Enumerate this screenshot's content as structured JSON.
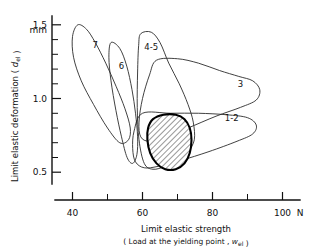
{
  "chart_data": {
    "type": "scatter",
    "title": "",
    "xlabel": "Limit elastic strength",
    "xlabel_sub": "( Load at the yielding point , w_el )",
    "ylabel": "Limit elastic deformation ( d_el )",
    "yunit": "mm",
    "xunit": "N",
    "xlim": [
      35,
      105
    ],
    "ylim": [
      0.42,
      1.56
    ],
    "xticks": [
      40,
      60,
      80,
      100
    ],
    "xticks_minor": [
      50,
      70,
      90
    ],
    "yticks": [
      0.5,
      1.0,
      1.5
    ],
    "yticks_minor": [
      0.6,
      0.7,
      0.8,
      0.9,
      1.1,
      1.2,
      1.3,
      1.4
    ],
    "xtick_labels": [
      "40",
      "60",
      "80",
      "100"
    ],
    "ytick_labels": [
      "0.5",
      "1.0",
      "1.5"
    ],
    "grid": false,
    "legend": "none",
    "note": "Overlapping closed contour regions (scatter envelopes) for seven sample groups, plus one bold hatched common-overlap region.",
    "series": [
      {
        "name": "7",
        "label": "7",
        "label_x": 46.5,
        "label_y": 1.34,
        "points": [
          [
            41.5,
            1.5
          ],
          [
            44.0,
            1.47
          ],
          [
            46.5,
            1.38
          ],
          [
            49.5,
            1.24
          ],
          [
            52.5,
            1.08
          ],
          [
            55.0,
            0.93
          ],
          [
            56.5,
            0.8
          ],
          [
            56.0,
            0.72
          ],
          [
            53.5,
            0.7
          ],
          [
            50.0,
            0.8
          ],
          [
            46.0,
            0.96
          ],
          [
            42.5,
            1.12
          ],
          [
            40.3,
            1.28
          ],
          [
            40.0,
            1.42
          ]
        ]
      },
      {
        "name": "6",
        "label": "6",
        "label_x": 54.0,
        "label_y": 1.2,
        "points": [
          [
            51.0,
            1.38
          ],
          [
            53.5,
            1.34
          ],
          [
            55.5,
            1.22
          ],
          [
            57.0,
            1.06
          ],
          [
            58.0,
            0.9
          ],
          [
            58.6,
            0.74
          ],
          [
            58.4,
            0.62
          ],
          [
            57.2,
            0.56
          ],
          [
            55.6,
            0.6
          ],
          [
            54.0,
            0.74
          ],
          [
            52.4,
            0.92
          ],
          [
            51.0,
            1.12
          ],
          [
            50.4,
            1.28
          ]
        ]
      },
      {
        "name": "4-5",
        "label": "4-5",
        "label_x": 62.5,
        "label_y": 1.33,
        "points": [
          [
            59.5,
            1.44
          ],
          [
            62.5,
            1.45
          ],
          [
            65.0,
            1.38
          ],
          [
            67.5,
            1.24
          ],
          [
            70.5,
            1.1
          ],
          [
            73.0,
            0.96
          ],
          [
            74.5,
            0.84
          ],
          [
            74.8,
            0.72
          ],
          [
            73.0,
            0.64
          ],
          [
            70.0,
            0.58
          ],
          [
            66.5,
            0.54
          ],
          [
            63.0,
            0.52
          ],
          [
            60.5,
            0.56
          ],
          [
            59.0,
            0.72
          ],
          [
            58.5,
            0.94
          ],
          [
            58.6,
            1.18
          ],
          [
            58.9,
            1.36
          ]
        ]
      },
      {
        "name": "3",
        "label": "3",
        "label_x": 88.0,
        "label_y": 1.08,
        "points": [
          [
            64.0,
            1.26
          ],
          [
            70.0,
            1.27
          ],
          [
            76.0,
            1.24
          ],
          [
            82.0,
            1.19
          ],
          [
            87.5,
            1.15
          ],
          [
            91.5,
            1.12
          ],
          [
            93.5,
            1.06
          ],
          [
            92.5,
            0.99
          ],
          [
            88.0,
            0.94
          ],
          [
            81.0,
            0.88
          ],
          [
            73.0,
            0.8
          ],
          [
            66.5,
            0.74
          ],
          [
            62.0,
            0.71
          ],
          [
            59.5,
            0.74
          ],
          [
            59.0,
            0.84
          ],
          [
            60.0,
            1.0
          ],
          [
            62.0,
            1.16
          ]
        ]
      },
      {
        "name": "1-2",
        "label": "1-2",
        "label_x": 85.5,
        "label_y": 0.85,
        "points": [
          [
            60.0,
            0.9
          ],
          [
            68.0,
            0.9
          ],
          [
            76.0,
            0.9
          ],
          [
            84.0,
            0.89
          ],
          [
            90.0,
            0.87
          ],
          [
            92.5,
            0.82
          ],
          [
            91.5,
            0.76
          ],
          [
            87.0,
            0.71
          ],
          [
            79.0,
            0.64
          ],
          [
            71.0,
            0.58
          ],
          [
            64.5,
            0.54
          ],
          [
            60.5,
            0.53
          ],
          [
            58.0,
            0.57
          ],
          [
            57.2,
            0.66
          ],
          [
            57.6,
            0.78
          ]
        ]
      },
      {
        "name": "overlap",
        "label": "",
        "label_x": 0,
        "label_y": 0,
        "hatched": true,
        "points": [
          [
            63.0,
            0.86
          ],
          [
            66.0,
            0.89
          ],
          [
            69.5,
            0.89
          ],
          [
            72.0,
            0.86
          ],
          [
            73.5,
            0.8
          ],
          [
            74.0,
            0.72
          ],
          [
            73.5,
            0.63
          ],
          [
            72.0,
            0.56
          ],
          [
            69.5,
            0.52
          ],
          [
            66.5,
            0.52
          ],
          [
            64.0,
            0.56
          ],
          [
            62.2,
            0.63
          ],
          [
            61.4,
            0.72
          ],
          [
            61.6,
            0.8
          ]
        ]
      }
    ]
  }
}
